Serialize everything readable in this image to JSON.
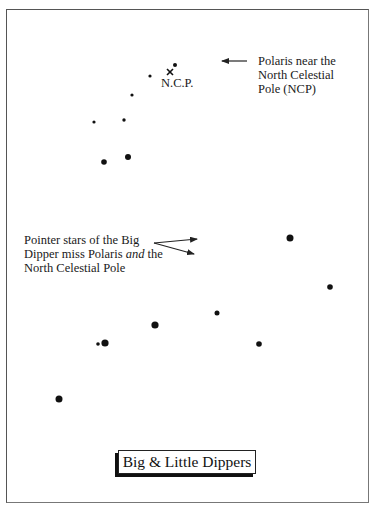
{
  "title": "Big & Little Dippers",
  "annotations": {
    "polaris": [
      "Polaris near the",
      "North Celestial",
      "Pole (NCP)"
    ],
    "pointers": {
      "line1": "Pointer stars of the Big",
      "line2_pre": "Dipper miss Polaris ",
      "line2_em": "and",
      "line2_post": " the",
      "line3": "North Celestial Pole"
    },
    "ncp_marker": "N.C.P."
  },
  "colors": {
    "star": "#111111",
    "frame": "#555555",
    "background": "#ffffff"
  },
  "stars": {
    "little_dipper": [
      {
        "name": "Polaris",
        "x": 175,
        "y": 65,
        "r": 2
      },
      {
        "x": 150,
        "y": 76,
        "r": 1.6
      },
      {
        "x": 132,
        "y": 95,
        "r": 1.6
      },
      {
        "x": 124,
        "y": 120,
        "r": 1.7
      },
      {
        "x": 94,
        "y": 122,
        "r": 1.6
      },
      {
        "x": 104,
        "y": 162,
        "r": 2.8
      },
      {
        "x": 128,
        "y": 157,
        "r": 3
      }
    ],
    "big_dipper": [
      {
        "x": 290,
        "y": 238,
        "r": 3.5
      },
      {
        "x": 330,
        "y": 287,
        "r": 2.8
      },
      {
        "x": 259,
        "y": 344,
        "r": 2.8
      },
      {
        "x": 217,
        "y": 313,
        "r": 2.5
      },
      {
        "x": 155,
        "y": 325,
        "r": 3.6
      },
      {
        "x": 105,
        "y": 343,
        "r": 3.6
      },
      {
        "name": "Alcor",
        "x": 98,
        "y": 344,
        "r": 1.8
      },
      {
        "x": 59,
        "y": 399,
        "r": 3.5
      }
    ]
  },
  "ncp": {
    "x": 170,
    "y": 72
  }
}
